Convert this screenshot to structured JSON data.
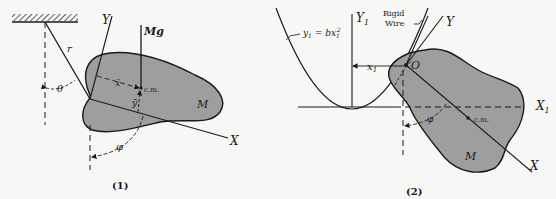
{
  "figure1": {
    "caption": "(1)",
    "labels": {
      "Y": "Y",
      "X": "X",
      "Mg": "Mg",
      "r": "r",
      "theta": "θ",
      "xbar": "x̄",
      "ybar": "ȳ",
      "cm": "c.m.",
      "M": "M",
      "phi": "φ"
    }
  },
  "figure2": {
    "caption": "(2)",
    "labels": {
      "Y1": "Y",
      "Y1_sub": "1",
      "X1": "X",
      "X1_sub": "1",
      "Y": "Y",
      "X": "X",
      "O": "O",
      "x1": "x",
      "x1_sub": "1",
      "rigid": "Rigid",
      "wire": "Wire",
      "equation_lhs": "y",
      "equation_lhs_sub": "1",
      "equation_eq": " = bx",
      "equation_sub": "1",
      "equation_sup": "2",
      "cm": "c.m.",
      "M": "M",
      "phi": "φ"
    }
  },
  "colors": {
    "body_fill": "#9e9e9e",
    "ink": "#1a1a1a",
    "background": "#f7f7f5"
  }
}
